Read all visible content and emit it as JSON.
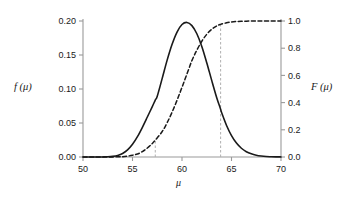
{
  "chart_data": {
    "type": "line",
    "title": "",
    "subtitle": "",
    "xlabel": "μ",
    "ylabel": "f (μ)",
    "ylabel_right": "F (μ)",
    "xlim": [
      50,
      70
    ],
    "ylim": [
      0.0,
      0.2
    ],
    "ylim_right": [
      0.0,
      1.0
    ],
    "grid": false,
    "legend": "none",
    "xticks": [
      50,
      55,
      60,
      65,
      70
    ],
    "xticklabels": [
      "50",
      "55",
      "60",
      "65",
      "70"
    ],
    "yticks": [
      0.0,
      0.05,
      0.1,
      0.15,
      0.2
    ],
    "yticklabels": [
      "0.00",
      "0.05",
      "0.10",
      "0.15",
      "0.20"
    ],
    "yticks_right": [
      0.0,
      0.2,
      0.4,
      0.6,
      0.8,
      1.0
    ],
    "yticklabels_right": [
      "0.0",
      "0.2",
      "0.4",
      "0.6",
      "0.8",
      "1.0"
    ],
    "series": [
      {
        "name": "f (μ)",
        "axis": "left",
        "style": "solid",
        "color": "#1a1a1a",
        "x": [
          50.0,
          50.5,
          51.0,
          51.5,
          52.0,
          52.5,
          53.0,
          53.5,
          54.0,
          54.5,
          55.0,
          55.5,
          56.0,
          56.5,
          57.0,
          57.3,
          57.5,
          58.0,
          58.5,
          59.0,
          59.5,
          60.0,
          60.5,
          61.0,
          61.5,
          62.0,
          62.5,
          63.0,
          63.5,
          63.9,
          64.0,
          64.5,
          65.0,
          65.5,
          66.0,
          66.5,
          67.0,
          67.5,
          68.0,
          68.5,
          69.0,
          69.5,
          70.0
        ],
        "y": [
          0.0,
          0.0,
          0.0,
          0.0,
          0.0001,
          0.0003,
          0.0009,
          0.0023,
          0.0052,
          0.0104,
          0.0186,
          0.0299,
          0.0437,
          0.0588,
          0.0742,
          0.0837,
          0.0894,
          0.1156,
          0.1425,
          0.1658,
          0.1838,
          0.1948,
          0.1979,
          0.1932,
          0.1812,
          0.1626,
          0.1387,
          0.1127,
          0.0876,
          0.0703,
          0.0654,
          0.0464,
          0.0315,
          0.0205,
          0.0129,
          0.0078,
          0.0046,
          0.0026,
          0.0014,
          0.0007,
          0.0004,
          0.0002,
          0.0001
        ]
      },
      {
        "name": "F (μ)",
        "axis": "right",
        "style": "dashed",
        "color": "#1a1a1a",
        "x": [
          50.0,
          51.0,
          52.0,
          53.0,
          54.0,
          54.5,
          55.0,
          55.5,
          56.0,
          56.5,
          57.0,
          57.3,
          58.0,
          58.5,
          59.0,
          59.5,
          60.0,
          60.5,
          61.0,
          61.5,
          62.0,
          62.5,
          63.0,
          63.5,
          63.9,
          64.5,
          65.0,
          65.5,
          66.0,
          66.5,
          67.0,
          67.5,
          68.0,
          69.0,
          70.0
        ],
        "y": [
          0.0,
          0.0,
          0.0002,
          0.0008,
          0.0027,
          0.0065,
          0.0129,
          0.022,
          0.0403,
          0.0661,
          0.0993,
          0.1233,
          0.1873,
          0.2525,
          0.3298,
          0.4176,
          0.5127,
          0.6111,
          0.7086,
          0.7855,
          0.8512,
          0.9022,
          0.9389,
          0.9636,
          0.9751,
          0.9868,
          0.9925,
          0.996,
          0.998,
          0.999,
          0.9996,
          0.9998,
          0.9999,
          1.0,
          1.0
        ]
      }
    ],
    "reference_lines": [
      {
        "name": "lower-reference-line",
        "x": 57.3,
        "y_top_right_axis": 0.12,
        "style": "dashed",
        "color": "#b0b0b0"
      },
      {
        "name": "upper-reference-line",
        "x": 63.9,
        "y_top_right_axis": 0.975,
        "style": "dashed",
        "color": "#b0b0b0"
      }
    ],
    "annotations": []
  },
  "axes": {
    "plot_left_px": 83,
    "plot_right_px": 281,
    "plot_top_px": 21,
    "plot_bottom_px": 157,
    "axis_color": "#9a9a9a"
  }
}
